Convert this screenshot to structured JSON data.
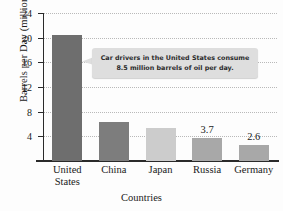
{
  "chart_data": {
    "type": "bar",
    "title": "",
    "xlabel": "Countries",
    "ylabel": "Barrels per Day (millions)",
    "categories": [
      "United States",
      "China",
      "Japan",
      "Russia",
      "Germany"
    ],
    "category_lines": [
      [
        "United",
        "States"
      ],
      [
        "China"
      ],
      [
        "Japan"
      ],
      [
        "Russia"
      ],
      [
        "Germany"
      ]
    ],
    "values": [
      20.5,
      6.3,
      5.4,
      3.7,
      2.6
    ],
    "bar_labels": [
      "",
      "",
      "",
      "3.7",
      "2.6"
    ],
    "bar_colors": [
      "#6e6e6e",
      "#7d7d7d",
      "#cccccc",
      "#a8a8a8",
      "#a8a8a8"
    ],
    "ylim": [
      0,
      24
    ],
    "yticks": [
      4,
      8,
      12,
      16,
      20,
      24
    ],
    "ytick_labels": [
      "4",
      "8",
      "12",
      "16",
      "20",
      "24"
    ],
    "grid": true,
    "grid_color": "#b9b9b9",
    "legend": "none",
    "axis_color": "#2a2a2a"
  },
  "annotation": {
    "line1": "Car drivers in the United States consume",
    "line2": "8.5 million barrels of oil per day.",
    "background": "#dedede",
    "points_to": "United States"
  }
}
